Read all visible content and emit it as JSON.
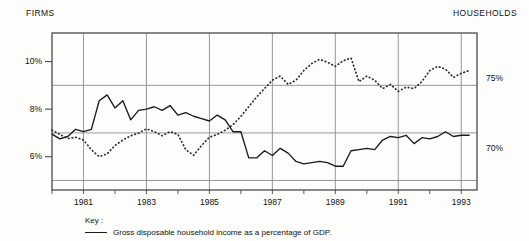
{
  "header": {
    "left_label": "FIRMS",
    "right_label": "HOUSEHOLDS"
  },
  "key": {
    "title": "Key :",
    "entries": [
      {
        "style": "solid",
        "label": "Gross disposable household income as a percentage of GDP."
      }
    ]
  },
  "chart_data": {
    "type": "line",
    "title": "",
    "xlabel": "",
    "grid": true,
    "legend_position": "below-plot-left",
    "x_ticks": [
      "1981",
      "1983",
      "1985",
      "1987",
      "1989",
      "1991",
      "1993"
    ],
    "x_tick_values": [
      1981,
      1983,
      1985,
      1987,
      1989,
      1991,
      1993
    ],
    "xlim": [
      1980.0,
      1993.5
    ],
    "minor_x_ticks": [
      1980,
      1981,
      1982,
      1983,
      1984,
      1985,
      1986,
      1987,
      1988,
      1989,
      1990,
      1991,
      1992,
      1993
    ],
    "axes": [
      {
        "id": "left",
        "side": "left",
        "label": "FIRMS",
        "tick_labels": [
          "10%",
          "8%",
          "6%"
        ],
        "tick_values": [
          10,
          8,
          6
        ],
        "ylim": [
          4.6,
          11.2
        ],
        "gridline_values": [
          9.0,
          7.0,
          5.0
        ]
      },
      {
        "id": "right",
        "side": "right",
        "label": "HOUSEHOLDS",
        "tick_labels": [
          "75%",
          "70%"
        ],
        "tick_values": [
          75,
          70
        ],
        "ylim": [
          67.0,
          78.3
        ],
        "gridline_values": [
          75,
          70
        ]
      }
    ],
    "series": [
      {
        "name": "Firms",
        "style": "solid",
        "axis": "left",
        "color": "#1a1a1a",
        "unit": "%",
        "x": [
          1980.0,
          1980.25,
          1980.5,
          1980.75,
          1981.0,
          1981.25,
          1981.5,
          1981.75,
          1982.0,
          1982.25,
          1982.5,
          1982.75,
          1983.0,
          1983.25,
          1983.5,
          1983.75,
          1984.0,
          1984.25,
          1984.5,
          1984.75,
          1985.0,
          1985.25,
          1985.5,
          1985.75,
          1986.0,
          1986.25,
          1986.5,
          1986.75,
          1987.0,
          1987.25,
          1987.5,
          1987.75,
          1988.0,
          1988.25,
          1988.5,
          1988.75,
          1989.0,
          1989.25,
          1989.5,
          1989.75,
          1990.0,
          1990.25,
          1990.5,
          1990.75,
          1991.0,
          1991.25,
          1991.5,
          1991.75,
          1992.0,
          1992.25,
          1992.5,
          1992.75,
          1993.0,
          1993.25
        ],
        "values": [
          6.95,
          6.75,
          6.85,
          7.15,
          7.05,
          7.15,
          8.35,
          8.6,
          8.05,
          8.35,
          7.55,
          7.95,
          8.0,
          8.1,
          7.95,
          8.15,
          7.75,
          7.85,
          7.7,
          7.6,
          7.5,
          7.75,
          7.55,
          7.05,
          7.05,
          5.95,
          5.95,
          6.25,
          6.05,
          6.35,
          6.15,
          5.8,
          5.7,
          5.75,
          5.8,
          5.75,
          5.6,
          5.6,
          6.25,
          6.3,
          6.35,
          6.3,
          6.7,
          6.85,
          6.8,
          6.9,
          6.55,
          6.8,
          6.75,
          6.85,
          7.05,
          6.85,
          6.9,
          6.9
        ]
      },
      {
        "name": "Households",
        "style": "dotted",
        "axis": "right",
        "color": "#2a2a2a",
        "unit": "%",
        "x": [
          1980.0,
          1980.25,
          1980.5,
          1980.75,
          1981.0,
          1981.25,
          1981.5,
          1981.75,
          1982.0,
          1982.25,
          1982.5,
          1982.75,
          1983.0,
          1983.25,
          1983.5,
          1983.75,
          1984.0,
          1984.25,
          1984.5,
          1984.75,
          1985.0,
          1985.25,
          1985.5,
          1985.75,
          1986.0,
          1986.25,
          1986.5,
          1986.75,
          1987.0,
          1987.25,
          1987.5,
          1987.75,
          1988.0,
          1988.25,
          1988.5,
          1988.75,
          1989.0,
          1989.25,
          1989.5,
          1989.75,
          1990.0,
          1990.25,
          1990.5,
          1990.75,
          1991.0,
          1991.25,
          1991.5,
          1991.75,
          1992.0,
          1992.25,
          1992.5,
          1992.75,
          1993.0,
          1993.25
        ],
        "values": [
          71.3,
          71.0,
          70.7,
          70.8,
          70.6,
          69.9,
          69.4,
          69.6,
          70.2,
          70.6,
          70.9,
          71.1,
          71.4,
          71.2,
          70.9,
          71.2,
          71.0,
          69.9,
          69.5,
          70.2,
          70.8,
          71.0,
          71.3,
          71.7,
          72.3,
          73.0,
          73.7,
          74.3,
          74.9,
          75.2,
          74.6,
          74.9,
          75.6,
          76.1,
          76.4,
          76.2,
          75.9,
          76.3,
          76.5,
          74.8,
          75.2,
          74.9,
          74.3,
          74.6,
          74.1,
          74.4,
          74.3,
          74.8,
          75.6,
          75.9,
          75.7,
          75.1,
          75.4,
          75.6
        ]
      }
    ]
  }
}
